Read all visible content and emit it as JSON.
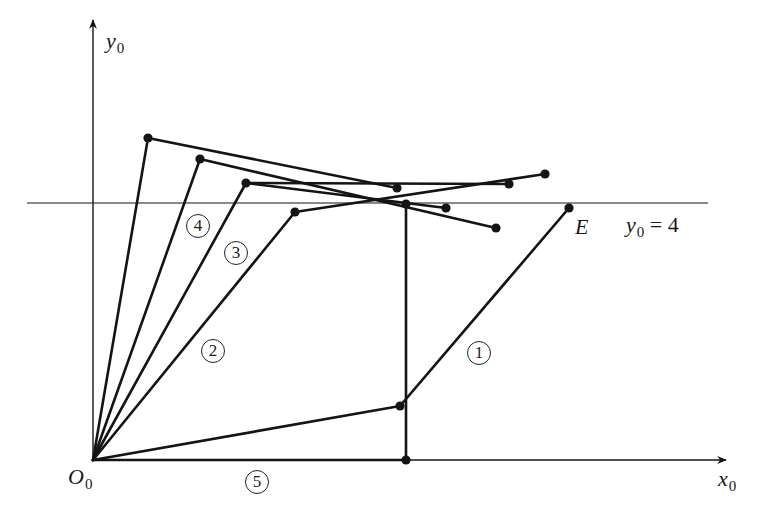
{
  "diagram": {
    "type": "linkage-path-diagram",
    "colors": {
      "stroke": "#141414",
      "background": "#ffffff"
    },
    "axes": {
      "x_label": {
        "base": "x",
        "sub": "0"
      },
      "y_label": {
        "base": "y",
        "sub": "0"
      },
      "origin_label": {
        "base": "O",
        "sub": "0"
      }
    },
    "reference_line": {
      "label_base": "y",
      "label_sub": "0",
      "label_rest": " = 4"
    },
    "endpoint_label": "E",
    "path_labels": [
      "1",
      "2",
      "3",
      "4",
      "5"
    ],
    "points": {
      "O": [
        93,
        460
      ],
      "A1": [
        148,
        138
      ],
      "A2": [
        397,
        188
      ],
      "B1": [
        200,
        159
      ],
      "B2": [
        496,
        228
      ],
      "C1": [
        246,
        183
      ],
      "C2": [
        509,
        184
      ],
      "C3": [
        446,
        208
      ],
      "D1": [
        295,
        212
      ],
      "D2": [
        545,
        174
      ],
      "V1": [
        406,
        203
      ],
      "V2": [
        406,
        460
      ],
      "F1": [
        400,
        406
      ],
      "E": [
        569,
        208
      ]
    }
  }
}
